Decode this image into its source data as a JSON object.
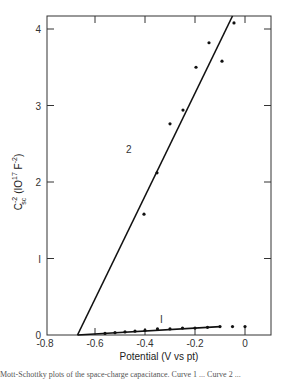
{
  "chart_data": {
    "type": "scatter",
    "title": "",
    "xlabel": "Potential (V vs pt)",
    "ylabel": "C_sc^-2 (10^17 F^-2)",
    "ylabel_parts": {
      "main": "C",
      "sup": "-2",
      "sub": "sc",
      "units": "(IO",
      "units_sup": "17",
      "units_f": " F",
      "units_f_sup": "-2",
      "close": ")"
    },
    "xlim": [
      -0.8,
      0.1
    ],
    "ylim": [
      0,
      4.17
    ],
    "xticks": [
      -0.8,
      -0.6,
      -0.4,
      -0.2,
      0
    ],
    "xtick_labels": [
      "-0.8",
      "-0.6",
      "-0.4",
      "-0.2",
      "0"
    ],
    "yticks": [
      0,
      1,
      2,
      3,
      4
    ],
    "ytick_labels": [
      "0",
      "I",
      "2",
      "3",
      "4"
    ],
    "grid": false,
    "legend": "none",
    "series": [
      {
        "name": "1",
        "label_text": "I",
        "points": [
          {
            "x": -0.56,
            "y": 0.02
          },
          {
            "x": -0.52,
            "y": 0.03
          },
          {
            "x": -0.48,
            "y": 0.04
          },
          {
            "x": -0.44,
            "y": 0.05
          },
          {
            "x": -0.4,
            "y": 0.06
          },
          {
            "x": -0.35,
            "y": 0.08
          },
          {
            "x": -0.3,
            "y": 0.08
          },
          {
            "x": -0.25,
            "y": 0.09
          },
          {
            "x": -0.2,
            "y": 0.09
          },
          {
            "x": -0.15,
            "y": 0.1
          },
          {
            "x": -0.1,
            "y": 0.11
          },
          {
            "x": -0.05,
            "y": 0.11
          },
          {
            "x": 0.0,
            "y": 0.11
          }
        ],
        "fit_line": {
          "x0": -0.67,
          "y0": 0.0,
          "x1": -0.1,
          "y1": 0.11
        }
      },
      {
        "name": "2",
        "label_text": "2",
        "points": [
          {
            "x": -0.404,
            "y": 1.58
          },
          {
            "x": -0.352,
            "y": 2.12
          },
          {
            "x": -0.3,
            "y": 2.76
          },
          {
            "x": -0.248,
            "y": 2.94
          },
          {
            "x": -0.196,
            "y": 3.5
          },
          {
            "x": -0.144,
            "y": 3.82
          },
          {
            "x": -0.092,
            "y": 3.58
          },
          {
            "x": -0.044,
            "y": 4.08
          }
        ],
        "fit_line": {
          "x0": -0.67,
          "y0": 0.0,
          "x1": -0.05,
          "y1": 4.17
        }
      }
    ]
  },
  "caption": "Mott-Schottky plots of the space-charge capacitance. Curve 1 ... Curve 2 ..."
}
